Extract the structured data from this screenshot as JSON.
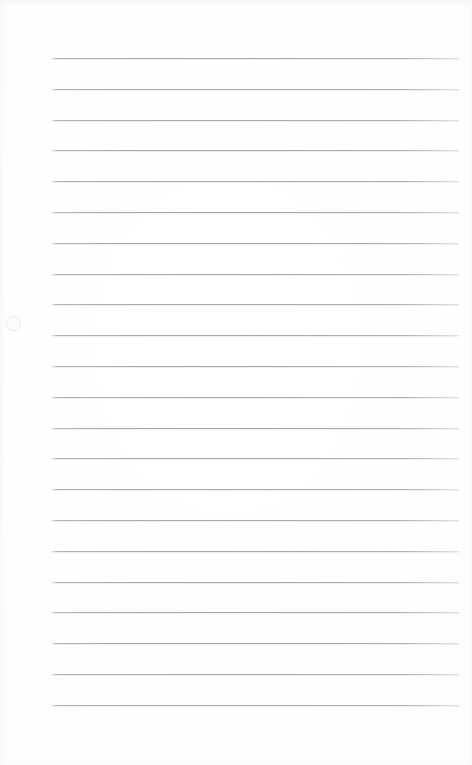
{
  "document": {
    "kind": "scanned-ruled-notepaper",
    "title": "Blank ruled paper",
    "page_width": 472,
    "page_height": 765,
    "background_color": "#fefefe",
    "text_content": "",
    "has_handwriting": false,
    "has_printed_text": false
  },
  "ruling": {
    "line_color": "#a9a9ad",
    "line_thickness_px": 1,
    "line_count": 22,
    "left_edge_px": 52,
    "right_edge_px": 459,
    "line_width_px": 407,
    "first_line_y_px": 58,
    "last_line_y_px": 704,
    "line_spacing_px": 30.8,
    "margins": {
      "top_px": 58,
      "bottom_px": 61,
      "left_px": 52,
      "right_px": 13
    },
    "line_y_positions": [
      58,
      88.8,
      119.6,
      150.4,
      181.2,
      212,
      242.8,
      273.6,
      304.4,
      335.2,
      366,
      396.8,
      427.6,
      458.4,
      489.2,
      520,
      550.8,
      581.6,
      612.4,
      643.2,
      674,
      704.8
    ]
  },
  "artifacts": {
    "edge_shading": "faint gray scan border on top and left",
    "smudge": "faint circular mark near left margin"
  }
}
